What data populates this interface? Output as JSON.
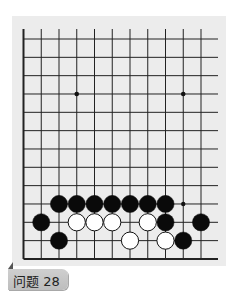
{
  "problem": {
    "label": "问题 28"
  },
  "board": {
    "colors": {
      "background": "#ececec",
      "line": "#222222",
      "black_stone": "#0a0a0a",
      "white_stone": "#ffffff"
    },
    "visible_columns": 11,
    "visible_rows": 13,
    "edges": [
      "left",
      "bottom"
    ],
    "star_points": [
      {
        "col": 3,
        "row": 3
      },
      {
        "col": 9,
        "row": 3
      }
    ],
    "markers": [
      {
        "col": 9,
        "row": 9,
        "type": "dot"
      }
    ],
    "stones": [
      {
        "col": 2,
        "row": 9,
        "color": "black"
      },
      {
        "col": 3,
        "row": 9,
        "color": "black"
      },
      {
        "col": 4,
        "row": 9,
        "color": "black"
      },
      {
        "col": 5,
        "row": 9,
        "color": "black"
      },
      {
        "col": 6,
        "row": 9,
        "color": "black"
      },
      {
        "col": 7,
        "row": 9,
        "color": "black"
      },
      {
        "col": 8,
        "row": 9,
        "color": "black"
      },
      {
        "col": 1,
        "row": 10,
        "color": "black"
      },
      {
        "col": 3,
        "row": 10,
        "color": "white"
      },
      {
        "col": 4,
        "row": 10,
        "color": "white"
      },
      {
        "col": 5,
        "row": 10,
        "color": "white"
      },
      {
        "col": 7,
        "row": 10,
        "color": "white"
      },
      {
        "col": 8,
        "row": 10,
        "color": "black"
      },
      {
        "col": 10,
        "row": 10,
        "color": "black"
      },
      {
        "col": 2,
        "row": 11,
        "color": "black"
      },
      {
        "col": 6,
        "row": 11,
        "color": "white"
      },
      {
        "col": 8,
        "row": 11,
        "color": "white"
      },
      {
        "col": 9,
        "row": 11,
        "color": "black"
      }
    ]
  }
}
